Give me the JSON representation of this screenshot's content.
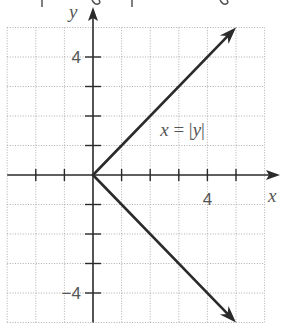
{
  "chart_data": {
    "type": "line",
    "title": "",
    "xlabel": "x",
    "ylabel": "y",
    "xlim": [
      -3,
      6
    ],
    "ylim": [
      -5,
      5
    ],
    "grid": true,
    "grid_style": "dotted",
    "x_ticks": [
      -2,
      -1,
      1,
      2,
      3,
      4,
      5
    ],
    "y_ticks": [
      -4,
      -3,
      -2,
      -1,
      1,
      2,
      3,
      4
    ],
    "x_tick_labels": [
      {
        "value": 4,
        "label": "4"
      }
    ],
    "y_tick_labels": [
      {
        "value": 4,
        "label": "4"
      },
      {
        "value": -4,
        "label": "−4"
      }
    ],
    "series": [
      {
        "name": "x = |y|",
        "points_upper": [
          [
            0,
            0
          ],
          [
            5,
            5
          ]
        ],
        "points_lower": [
          [
            0,
            0
          ],
          [
            5,
            -5
          ]
        ],
        "arrow_ends": true,
        "color": "#2b2b2b"
      }
    ],
    "annotations": [
      {
        "text_var_left": "x",
        "text_eq": " = |",
        "text_var_right": "y",
        "text_close": "|",
        "x": 2.35,
        "y": 1.0
      }
    ]
  }
}
